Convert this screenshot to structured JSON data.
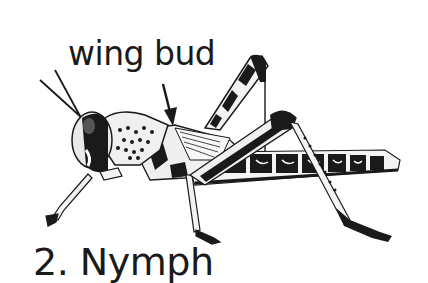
{
  "figure": {
    "annotation": {
      "label": "wing bud",
      "pointer": "arrow pointing down to wing bud"
    },
    "caption": "2. Nymph"
  },
  "colors": {
    "background": "#ffffff",
    "ink": "#1a1a1a",
    "shade": "#8a8a8a",
    "light": "#e6e6e6"
  }
}
